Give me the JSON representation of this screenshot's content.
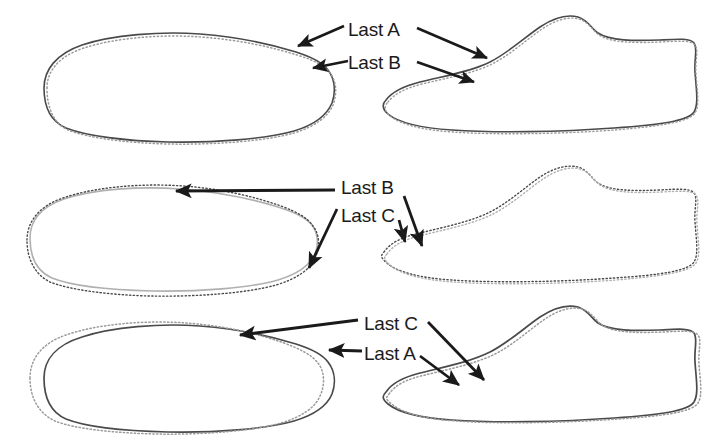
{
  "figure": {
    "background_color": "#ffffff",
    "ink_color": "#1a1a1a",
    "solid_outline_color": "#4a4a4a",
    "dotted_outline_color": "#9a9a9a"
  },
  "rows": [
    {
      "id": "row-1",
      "pair": "A-vs-B",
      "labels": [
        {
          "id": "row1-label-a",
          "text": "Last A",
          "x": 348,
          "y": 36
        },
        {
          "id": "row1-label-b",
          "text": "Last B",
          "x": 348,
          "y": 69
        }
      ],
      "views": [
        {
          "id": "row1-plan-view",
          "name": "plan-view",
          "side": "left"
        },
        {
          "id": "row1-profile-view",
          "name": "profile-view",
          "side": "right"
        }
      ],
      "arrows": [
        {
          "id": "row1-arrow-a-left",
          "label": "Last A",
          "from": [
            344,
            26
          ],
          "to": [
            294,
            48
          ]
        },
        {
          "id": "row1-arrow-a-right",
          "label": "Last A",
          "from": [
            417,
            28
          ],
          "to": [
            492,
            60
          ]
        },
        {
          "id": "row1-arrow-b-left",
          "label": "Last B",
          "from": [
            344,
            62
          ],
          "to": [
            308,
            69
          ]
        },
        {
          "id": "row1-arrow-b-right",
          "label": "Last B",
          "from": [
            417,
            62
          ],
          "to": [
            478,
            84
          ]
        }
      ]
    },
    {
      "id": "row-2",
      "pair": "B-vs-C",
      "labels": [
        {
          "id": "row2-label-b",
          "text": "Last B",
          "x": 341,
          "y": 194
        },
        {
          "id": "row2-label-c",
          "text": "Last C",
          "x": 341,
          "y": 222
        }
      ],
      "views": [
        {
          "id": "row2-plan-view",
          "name": "plan-view",
          "side": "left"
        },
        {
          "id": "row2-profile-view",
          "name": "profile-view",
          "side": "right"
        }
      ],
      "arrows": [
        {
          "id": "row2-arrow-b-left",
          "label": "Last B",
          "from": [
            335,
            190
          ],
          "to": [
            172,
            191
          ]
        },
        {
          "id": "row2-arrow-b-right",
          "label": "Last B",
          "from": [
            404,
            196
          ],
          "to": [
            424,
            250
          ]
        },
        {
          "id": "row2-arrow-c-left",
          "label": "Last C",
          "from": [
            337,
            209
          ],
          "to": [
            307,
            272
          ]
        },
        {
          "id": "row2-arrow-c-right",
          "label": "Last C",
          "from": [
            400,
            222
          ],
          "to": [
            406,
            246
          ]
        }
      ]
    },
    {
      "id": "row-3",
      "pair": "C-vs-A",
      "labels": [
        {
          "id": "row3-label-c",
          "text": "Last C",
          "x": 364,
          "y": 330
        },
        {
          "id": "row3-label-a",
          "text": "Last A",
          "x": 364,
          "y": 360
        }
      ],
      "views": [
        {
          "id": "row3-plan-view",
          "name": "plan-view",
          "side": "left"
        },
        {
          "id": "row3-profile-view",
          "name": "profile-view",
          "side": "right"
        }
      ],
      "arrows": [
        {
          "id": "row3-arrow-c-left",
          "label": "Last C",
          "from": [
            358,
            320
          ],
          "to": [
            236,
            336
          ]
        },
        {
          "id": "row3-arrow-c-right",
          "label": "Last C",
          "from": [
            428,
            322
          ],
          "to": [
            487,
            384
          ]
        },
        {
          "id": "row3-arrow-a-left",
          "label": "Last A",
          "from": [
            358,
            352
          ],
          "to": [
            325,
            350
          ]
        },
        {
          "id": "row3-arrow-a-right",
          "label": "Last A",
          "from": [
            420,
            356
          ],
          "to": [
            462,
            388
          ]
        }
      ]
    }
  ],
  "legend": {
    "last_names": [
      "Last A",
      "Last B",
      "Last C"
    ]
  }
}
